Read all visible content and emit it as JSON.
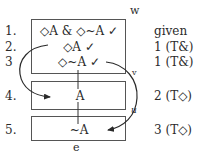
{
  "diagram": {
    "world_labels": {
      "top": "w",
      "bottom": "e",
      "arc_right_top": "v",
      "arc_right_bottom": "u"
    },
    "lines": [
      {
        "number": "1.",
        "formula": "◇A & ◇~A ✓",
        "justification": "given"
      },
      {
        "number": "2.",
        "formula": "◇A ✓",
        "justification": "1 (T&)"
      },
      {
        "number": "3",
        "formula": "◇~A ✓",
        "justification": "1 (T&)"
      },
      {
        "number": "4.",
        "formula": "A",
        "justification": "2 (T◇)"
      },
      {
        "number": "5.",
        "formula": "~A",
        "justification": "3 (T◇)"
      }
    ],
    "worlds": [
      {
        "name": "world-w",
        "lines": [
          1,
          2,
          3
        ]
      },
      {
        "name": "world-v",
        "lines": [
          4
        ]
      },
      {
        "name": "world-u",
        "lines": [
          5
        ]
      }
    ],
    "colors": {
      "ink": "#2a2a2a",
      "box": "#555555",
      "background": "#ffffff"
    }
  }
}
